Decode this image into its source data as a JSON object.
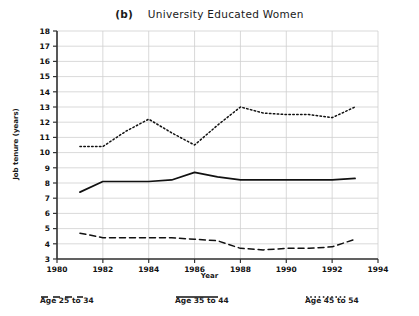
{
  "chart_data": {
    "type": "line",
    "title": "University Educated Women",
    "panel_label": "(b)",
    "xlabel": "Year",
    "ylabel": "Job tenure (years)",
    "xlim": [
      1980,
      1994
    ],
    "ylim": [
      3,
      18
    ],
    "xticks": [
      1980,
      1982,
      1984,
      1986,
      1988,
      1990,
      1992,
      1994
    ],
    "yticks": [
      3,
      4,
      5,
      6,
      7,
      8,
      9,
      10,
      11,
      12,
      13,
      14,
      15,
      16,
      17,
      18
    ],
    "grid": true,
    "legend_position": "bottom",
    "x": [
      1981,
      1982,
      1983,
      1984,
      1985,
      1986,
      1987,
      1988,
      1989,
      1990,
      1991,
      1992,
      1993
    ],
    "series": [
      {
        "name": "Age 25 to 34",
        "style": "dashed",
        "color": "#111111",
        "values": [
          4.7,
          4.4,
          4.4,
          4.4,
          4.4,
          4.3,
          4.2,
          3.7,
          3.6,
          3.7,
          3.7,
          3.8,
          4.3
        ]
      },
      {
        "name": "Age 35 to 44",
        "style": "solid",
        "color": "#111111",
        "values": [
          7.4,
          8.1,
          8.1,
          8.1,
          8.2,
          8.7,
          8.4,
          8.2,
          8.2,
          8.2,
          8.2,
          8.2,
          8.3
        ]
      },
      {
        "name": "Age 45 to 54",
        "style": "dotted",
        "color": "#111111",
        "values": [
          10.4,
          10.4,
          11.4,
          12.2,
          11.3,
          10.5,
          11.8,
          13.0,
          12.6,
          12.5,
          12.5,
          12.3,
          13.0
        ]
      }
    ]
  },
  "axis": {
    "ytick_labels": [
      "18",
      "17",
      "16",
      "15",
      "14",
      "13",
      "12",
      "11",
      "10",
      "9",
      "8",
      "7",
      "6",
      "5",
      "4",
      "3"
    ],
    "xtick_labels": [
      "1980",
      "1982",
      "1984",
      "1986",
      "1988",
      "1990",
      "1992",
      "1994"
    ]
  },
  "legend": {
    "items": [
      {
        "label": "Age 25 to 34",
        "style": "dashed"
      },
      {
        "label": "Age 35 to 44",
        "style": "solid"
      },
      {
        "label": "Age 45 to 54",
        "style": "dotted"
      }
    ]
  },
  "colors": {
    "line": "#111111",
    "grid": "#cfcfcf",
    "axis": "#333333",
    "background": "#ffffff"
  }
}
